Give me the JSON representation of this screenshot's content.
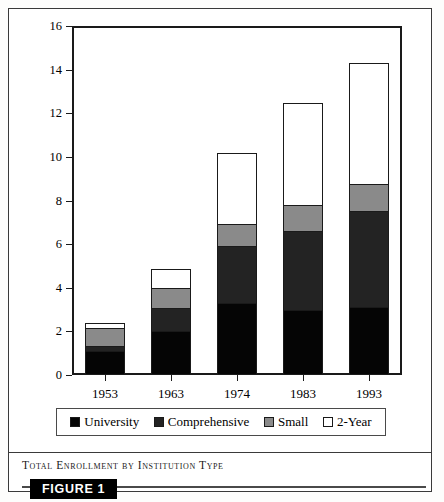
{
  "figure": {
    "caption": "Total Enrollment by Institution Type",
    "figure_tag": "FIGURE 1"
  },
  "chart_data": {
    "type": "bar",
    "stacked": true,
    "title": "Total Enrollment by Institution Type",
    "xlabel": "",
    "ylabel": "Millions of Students",
    "categories": [
      "1953",
      "1963",
      "1974",
      "1983",
      "1993"
    ],
    "ylim": [
      0,
      16
    ],
    "yticks": [
      0,
      2,
      4,
      6,
      8,
      10,
      12,
      14,
      16
    ],
    "grid": false,
    "legend_position": "bottom",
    "series": [
      {
        "name": "University",
        "color": "#050505",
        "values": [
          1.1,
          2.0,
          3.3,
          2.95,
          3.1
        ]
      },
      {
        "name": "Comprehensive",
        "color": "#232323",
        "values": [
          0.25,
          1.1,
          2.6,
          3.65,
          4.4
        ]
      },
      {
        "name": "Small",
        "color": "#8a8a8a",
        "values": [
          0.85,
          0.9,
          1.05,
          1.2,
          1.25
        ]
      },
      {
        "name": "2-Year",
        "color": "#ffffff",
        "values": [
          0.2,
          0.85,
          3.25,
          4.65,
          5.55
        ]
      }
    ],
    "totals": [
      2.2,
      4.85,
      10.2,
      12.45,
      14.3
    ]
  },
  "axis": {
    "y_ticks": [
      "16",
      "14",
      "12",
      "10",
      "8",
      "6",
      "4",
      "2",
      "0"
    ],
    "y_title": "Millions of Students",
    "x_ticks": [
      "1953",
      "1963",
      "1974",
      "1983",
      "1993"
    ]
  },
  "legend": {
    "items": [
      {
        "label": "University",
        "color": "#050505"
      },
      {
        "label": "Comprehensive",
        "color": "#232323"
      },
      {
        "label": "Small",
        "color": "#8a8a8a"
      },
      {
        "label": "2-Year",
        "color": "#ffffff"
      }
    ]
  }
}
